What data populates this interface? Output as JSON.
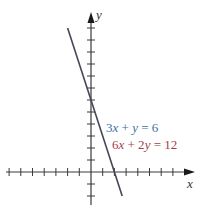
{
  "chart_data": {
    "type": "line",
    "title": "",
    "xlabel": "x",
    "ylabel": "y",
    "xlim": [
      -7,
      8.6
    ],
    "ylim": [
      -2.8,
      13.3
    ],
    "x_ticks": [
      -7,
      -6,
      -5,
      -4,
      -3,
      -2,
      -1,
      1,
      2,
      3,
      4,
      5,
      6,
      7
    ],
    "y_ticks": [
      -2,
      -1,
      1,
      2,
      3,
      4,
      5,
      6,
      7,
      8,
      9,
      10,
      11,
      12
    ],
    "tick_labels_shown": false,
    "grid": false,
    "series": [
      {
        "name": "3x + y = 6",
        "color": "#3d6fa8",
        "equation": "3x + y = 6",
        "x": [
          -2,
          2.667
        ],
        "y": [
          12,
          -2
        ]
      },
      {
        "name": "6x + 2y = 12",
        "color": "#a3404c",
        "equation": "6x + 2y = 12",
        "x": [
          -2,
          2.667
        ],
        "y": [
          12,
          -2
        ]
      }
    ],
    "annotations": [
      {
        "text": "3x + y = 6",
        "color": "#3d6fa8",
        "x": 1.25,
        "y": 3.6
      },
      {
        "text": "6x + 2y = 12",
        "color": "#a3404c",
        "x": 1.75,
        "y": 2.2
      }
    ],
    "note": "Both equations describe the same line (coincident lines)"
  },
  "labels": {
    "x_axis": "x",
    "y_axis": "y",
    "eq1": {
      "coef_a": "3",
      "var1": "x",
      "op1": " + ",
      "var2": "y",
      "rhs": " = 6"
    },
    "eq2": {
      "coef_a": "6",
      "var1": "x",
      "op1": " + 2",
      "var2": "y",
      "rhs": " = 12"
    }
  },
  "colors": {
    "axis": "#3a3a3a",
    "line": "#4a4458",
    "eq1": "#3d6fa8",
    "eq2": "#a3404c"
  }
}
